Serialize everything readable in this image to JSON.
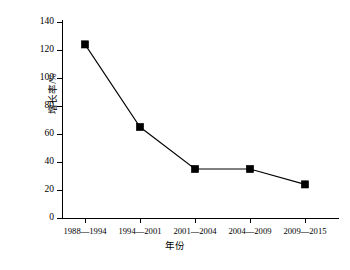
{
  "chart_data": {
    "type": "line",
    "title": "",
    "subtitle": "",
    "xlabel": "年份",
    "ylabel": "增长率/%",
    "categories": [
      "1988—1994",
      "1994—2001",
      "2001—2004",
      "2004—2009",
      "2009—2015"
    ],
    "values": [
      124,
      65,
      35,
      35,
      24
    ],
    "series": [
      {
        "name": "增长率",
        "values": [
          124,
          65,
          35,
          35,
          24
        ]
      }
    ],
    "ylim": [
      0,
      140
    ],
    "yticks": [
      0,
      20,
      40,
      60,
      80,
      100,
      120,
      140
    ],
    "ytick_labels": [
      "0",
      "20",
      "40",
      "60",
      "80",
      "100",
      "120",
      "140"
    ],
    "xtick_labels": [
      "1988—1994",
      "1994—2001",
      "2001—2004",
      "2004—2009",
      "2009—2015"
    ],
    "grid": false,
    "legend": false,
    "legend_position": "none",
    "marker": "filled-square",
    "line_color": "#000000",
    "marker_color": "#000000",
    "background_color": "#ffffff",
    "annotations": []
  },
  "axes": {
    "y_title": "增长率/%",
    "x_title": "年份"
  }
}
